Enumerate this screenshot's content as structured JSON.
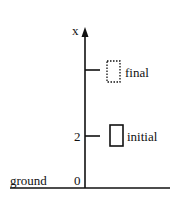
{
  "diagram": {
    "axis": {
      "label": "x",
      "color": "#111111"
    },
    "ticks": [
      {
        "value_label": "",
        "name": "final",
        "label": "final",
        "style": "dashed"
      },
      {
        "value_label": "2",
        "name": "initial",
        "label": "initial",
        "style": "solid"
      }
    ],
    "ground": {
      "label": "ground",
      "origin_label": "0"
    }
  }
}
